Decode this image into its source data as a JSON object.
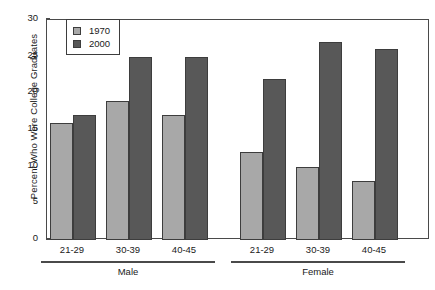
{
  "chart_data": {
    "type": "bar",
    "title": "",
    "xlabel": "",
    "ylabel": "Percent Who Were College Graduates",
    "ylim": [
      0,
      30
    ],
    "yticks": [
      0,
      5,
      10,
      15,
      20,
      25,
      30
    ],
    "ytick_labels": [
      "0",
      "5",
      "10",
      "15",
      "20",
      "25",
      "30"
    ],
    "grid": false,
    "legend_position": "upper left inside",
    "categories": [
      "21-29",
      "30-39",
      "40-45",
      "21-29",
      "30-39",
      "40-45"
    ],
    "groups": [
      {
        "label": "Male",
        "categories": [
          "21-29",
          "30-39",
          "40-45"
        ]
      },
      {
        "label": "Female",
        "categories": [
          "21-29",
          "30-39",
          "40-45"
        ]
      }
    ],
    "series": [
      {
        "name": "1970",
        "color": "#a8a8a8",
        "values": [
          16,
          19,
          17,
          12,
          10,
          8
        ]
      },
      {
        "name": "2000",
        "color": "#585858",
        "values": [
          17,
          25,
          25,
          22,
          27,
          26
        ]
      }
    ]
  },
  "legend": {
    "items": [
      {
        "label": "1970",
        "color": "#a8a8a8"
      },
      {
        "label": "2000",
        "color": "#585858"
      }
    ]
  },
  "axis": {
    "y_title": "Percent Who Were College Graduates",
    "y_tick_labels": [
      "30",
      "25",
      "20",
      "15",
      "10",
      "5",
      "0"
    ]
  },
  "x_axis": {
    "tick_labels": [
      "21-29",
      "30-39",
      "40-45",
      "21-29",
      "30-39",
      "40-45"
    ],
    "group_labels": [
      "Male",
      "Female"
    ]
  },
  "caption": {
    "text": ""
  }
}
